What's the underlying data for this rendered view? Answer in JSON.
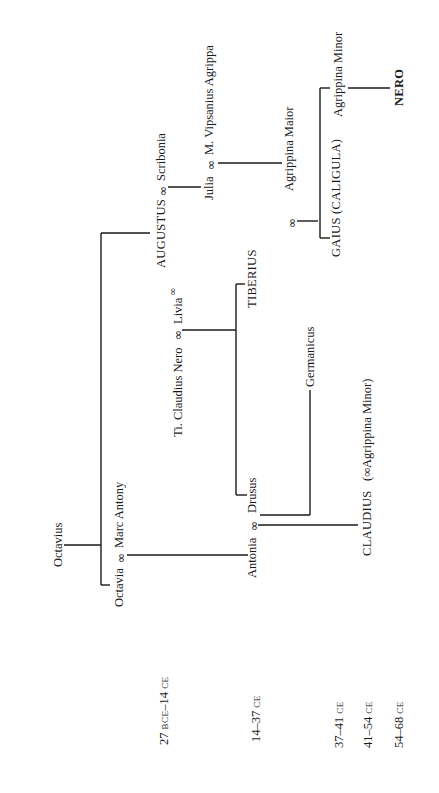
{
  "diagram": {
    "orientation": "rotated 90 degrees counter-clockwise",
    "marriage_symbol": "∞",
    "people": {
      "octavius": "Octavius",
      "octavia": "Octavia",
      "marc_antony": "Marc Antony",
      "augustus": "AUGUSTUS",
      "scribonia": "Scribonia",
      "julia": "Julia",
      "agrippa": "M. Vipsanius Agrippa",
      "agrippina_maior": "Agrippina Maior",
      "ti_claudius_nero": "Ti. Claudius Nero",
      "livia": "Livia",
      "tiberius": "TIBERIUS",
      "antonia": "Antonia",
      "drusus": "Drusus",
      "germanicus": "Germanicus",
      "claudius": "CLAUDIUS",
      "claudius_note": "(∞Agrippina Minor)",
      "gaius": "GAIUS (CALIGULA)",
      "agrippina_minor": "Agrippina Minor",
      "nero": "NERO"
    },
    "reigns": [
      {
        "years": "27",
        "era1": "BCE",
        "sep": "–14",
        "era2": "CE"
      },
      {
        "years": "14–37",
        "era": "CE"
      },
      {
        "years": "37–41",
        "era": "CE"
      },
      {
        "years": "41–54",
        "era": "CE"
      },
      {
        "years": "54–68",
        "era": "CE"
      }
    ]
  }
}
